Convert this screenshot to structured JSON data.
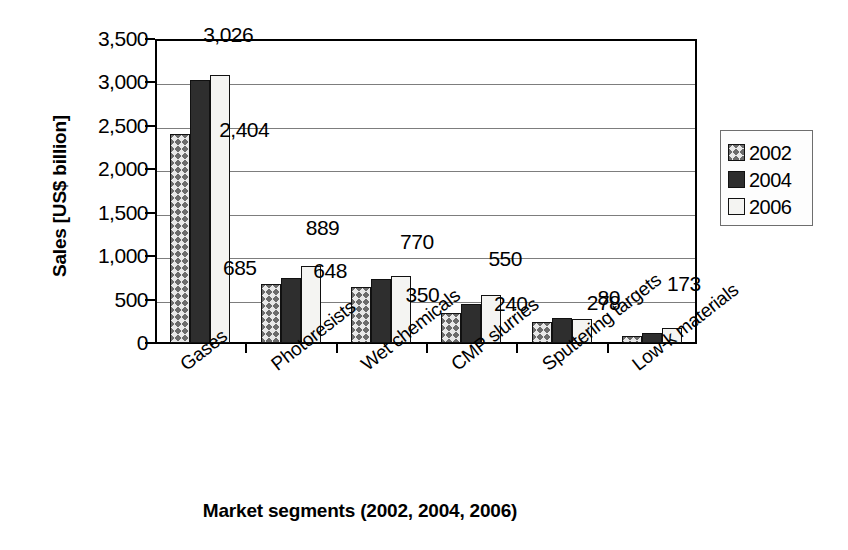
{
  "chart_data": {
    "type": "bar",
    "title": "",
    "xlabel": "Market segments (2002, 2004, 2006)",
    "ylabel": "Sales [US$ billion]",
    "categories": [
      "Gases",
      "Photoresists",
      "Wet chemicals",
      "CMP slurries",
      "Sputtering targets",
      "Low-k materials"
    ],
    "series": [
      {
        "name": "2002",
        "values": [
          2404,
          685,
          648,
          350,
          240,
          80
        ]
      },
      {
        "name": "2004",
        "values": [
          3026,
          750,
          740,
          450,
          285,
          120
        ]
      },
      {
        "name": "2006",
        "values": [
          3080,
          889,
          770,
          550,
          278,
          173
        ]
      }
    ],
    "ylim": [
      0,
      3500
    ],
    "yticks": [
      0,
      500,
      1000,
      1500,
      2000,
      2500,
      3000,
      3500
    ],
    "ytick_labels": [
      "0",
      "500",
      "1,000",
      "1,500",
      "2,000",
      "2,500",
      "3,000",
      "3,500"
    ],
    "grid": true,
    "legend_position": "right",
    "legend_entries": [
      "2002",
      "2004",
      "2006"
    ],
    "annotations": [
      {
        "text": "2,404",
        "category": "Gases",
        "series": "2002",
        "value": 2404
      },
      {
        "text": "3,026",
        "category": "Gases",
        "series": "2006",
        "value": 3026
      },
      {
        "text": "685",
        "category": "Photoresists",
        "series": "2002",
        "value": 685
      },
      {
        "text": "889",
        "category": "Photoresists",
        "series": "2006",
        "value": 889
      },
      {
        "text": "648",
        "category": "Wet chemicals",
        "series": "2002",
        "value": 648
      },
      {
        "text": "770",
        "category": "Wet chemicals",
        "series": "2006",
        "value": 770
      },
      {
        "text": "350",
        "category": "CMP slurries",
        "series": "2002",
        "value": 350
      },
      {
        "text": "550",
        "category": "CMP slurries",
        "series": "2006",
        "value": 550
      },
      {
        "text": "240",
        "category": "Sputtering targets",
        "series": "2002",
        "value": 240
      },
      {
        "text": "278",
        "category": "Sputtering targets",
        "series": "2006",
        "value": 278
      },
      {
        "text": "80",
        "category": "Low-k materials",
        "series": "2002",
        "value": 80
      },
      {
        "text": "173",
        "category": "Low-k materials",
        "series": "2006",
        "value": 173
      }
    ],
    "series_styles": [
      {
        "name": "2002",
        "fill": "cross-hatch",
        "color": "#e8e8e8",
        "hatch_color": "#6b6b6b"
      },
      {
        "name": "2004",
        "fill": "solid",
        "color": "#2e2e2e"
      },
      {
        "name": "2006",
        "fill": "solid",
        "color": "#f4f4f2"
      }
    ]
  }
}
